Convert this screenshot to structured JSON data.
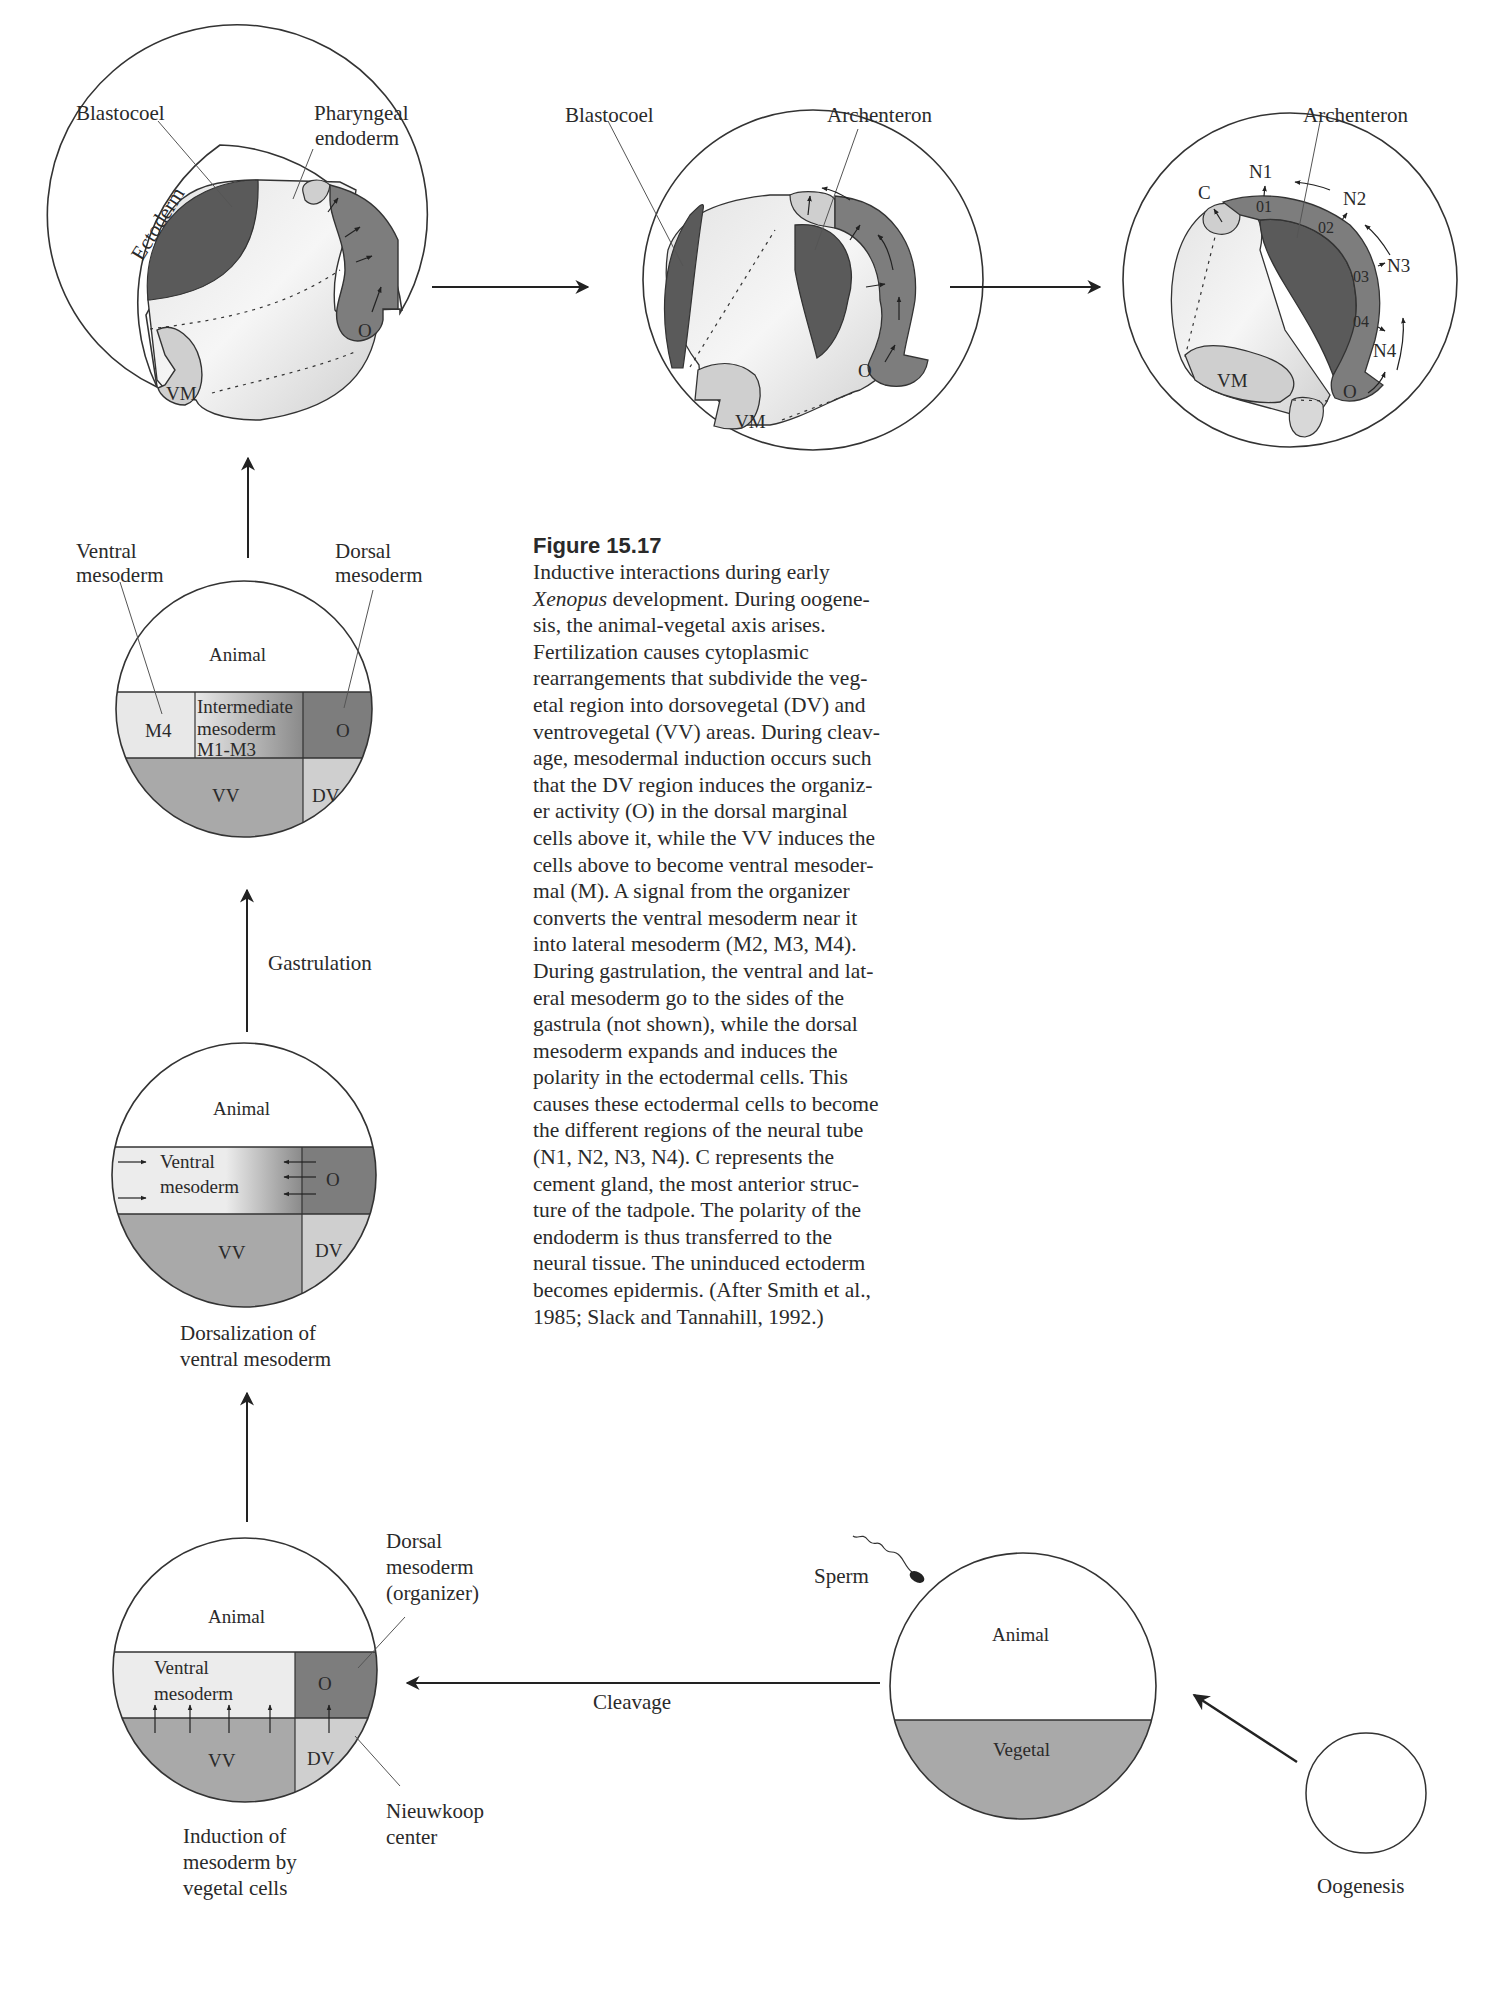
{
  "figure": {
    "number": "Figure 15.17",
    "caption_lines": [
      {
        "pre": "",
        "em": "",
        "post": "Inductive interactions during early"
      },
      {
        "pre": "",
        "em": "Xenopus",
        "post": " development. During oogene-"
      },
      {
        "pre": "",
        "em": "",
        "post": "sis, the animal-vegetal axis arises."
      },
      {
        "pre": "",
        "em": "",
        "post": "Fertilization causes cytoplasmic"
      },
      {
        "pre": "",
        "em": "",
        "post": "rearrangements that subdivide the veg-"
      },
      {
        "pre": "",
        "em": "",
        "post": "etal region into dorsovegetal (DV) and"
      },
      {
        "pre": "",
        "em": "",
        "post": "ventrovegetal (VV) areas. During cleav-"
      },
      {
        "pre": "",
        "em": "",
        "post": "age, mesodermal induction occurs such"
      },
      {
        "pre": "",
        "em": "",
        "post": "that the DV region induces the organiz-"
      },
      {
        "pre": "",
        "em": "",
        "post": "er activity (O) in the dorsal marginal"
      },
      {
        "pre": "",
        "em": "",
        "post": "cells above it, while the VV induces the"
      },
      {
        "pre": "",
        "em": "",
        "post": "cells above to become ventral mesoder-"
      },
      {
        "pre": "",
        "em": "",
        "post": "mal (M). A signal from the organizer"
      },
      {
        "pre": "",
        "em": "",
        "post": "converts the ventral mesoderm near it"
      },
      {
        "pre": "",
        "em": "",
        "post": "into lateral mesoderm (M2, M3, M4)."
      },
      {
        "pre": "",
        "em": "",
        "post": "During gastrulation, the ventral and lat-"
      },
      {
        "pre": "",
        "em": "",
        "post": "eral mesoderm go to the sides of the"
      },
      {
        "pre": "",
        "em": "",
        "post": "gastrula (not shown), while the dorsal"
      },
      {
        "pre": "",
        "em": "",
        "post": "mesoderm expands and induces the"
      },
      {
        "pre": "",
        "em": "",
        "post": "polarity in the ectodermal cells. This"
      },
      {
        "pre": "",
        "em": "",
        "post": "causes these ectodermal cells to become"
      },
      {
        "pre": "",
        "em": "",
        "post": "the different regions of the neural tube"
      },
      {
        "pre": "",
        "em": "",
        "post": "(N1, N2, N3, N4). C represents the"
      },
      {
        "pre": "",
        "em": "",
        "post": "cement gland, the most anterior struc-"
      },
      {
        "pre": "",
        "em": "",
        "post": "ture of the tadpole. The polarity of the"
      },
      {
        "pre": "",
        "em": "",
        "post": "endoderm is thus transferred to the"
      },
      {
        "pre": "",
        "em": "",
        "post": "neural tissue. The uninduced ectoderm"
      },
      {
        "pre": "",
        "em": "",
        "post": "becomes epidermis. (After Smith et al.,"
      },
      {
        "pre": "",
        "em": "",
        "post": "1985; Slack and Tannahill, 1992.)"
      }
    ]
  },
  "colors": {
    "background": "#ffffff",
    "outline": "#333333",
    "dark_region": "#5a5a5a",
    "organizer": "#7d7d7d",
    "vegetal": "#a9a9a9",
    "light_region": "#d2d2d2",
    "pale_region": "#e6e6e6"
  },
  "stages": {
    "gastrula_early": {
      "labels": {
        "blastocoel": "Blastocoel",
        "pharyngeal_1": "Pharyngeal",
        "pharyngeal_2": "endoderm",
        "ectoderm": "Ectoderm",
        "vm": "VM",
        "o": "O"
      }
    },
    "gastrula_mid": {
      "labels": {
        "blastocoel": "Blastocoel",
        "archenteron": "Archenteron",
        "vm": "VM",
        "o": "O"
      }
    },
    "gastrula_late": {
      "labels": {
        "archenteron": "Archenteron",
        "c": "C",
        "vm": "VM",
        "o": "O",
        "n1": "N1",
        "n2": "N2",
        "n3": "N3",
        "n4": "N4",
        "o1": "01",
        "o2": "02",
        "o3": "03",
        "o4": "04"
      }
    },
    "blastula_regions": {
      "labels": {
        "ventral_1": "Ventral",
        "ventral_2": "mesoderm",
        "dorsal_1": "Dorsal",
        "dorsal_2": "mesoderm",
        "animal": "Animal",
        "m4": "M4",
        "inter_1": "Intermediate",
        "inter_2": "mesoderm",
        "inter_3": "M1-M3",
        "o": "O",
        "vv": "VV",
        "dv": "DV"
      }
    },
    "dorsalization": {
      "labels": {
        "animal": "Animal",
        "ventral_1": "Ventral",
        "ventral_2": "mesoderm",
        "o": "O",
        "vv": "VV",
        "dv": "DV",
        "caption_1": "Dorsalization of",
        "caption_2": "ventral mesoderm"
      }
    },
    "induction": {
      "labels": {
        "animal": "Animal",
        "ventral_1": "Ventral",
        "ventral_2": "mesoderm",
        "o": "O",
        "vv": "VV",
        "dv": "DV",
        "dorsal_1": "Dorsal",
        "dorsal_2": "mesoderm",
        "dorsal_3": "(organizer)",
        "nieuwkoop_1": "Nieuwkoop",
        "nieuwkoop_2": "center",
        "caption_1": "Induction of",
        "caption_2": "mesoderm by",
        "caption_3": "vegetal cells"
      }
    },
    "fertilized_egg": {
      "labels": {
        "sperm": "Sperm",
        "animal": "Animal",
        "vegetal": "Vegetal"
      }
    },
    "oocyte": {
      "labels": {
        "caption": "Oogenesis"
      }
    }
  },
  "transitions": {
    "gastrulation": "Gastrulation",
    "cleavage": "Cleavage"
  }
}
